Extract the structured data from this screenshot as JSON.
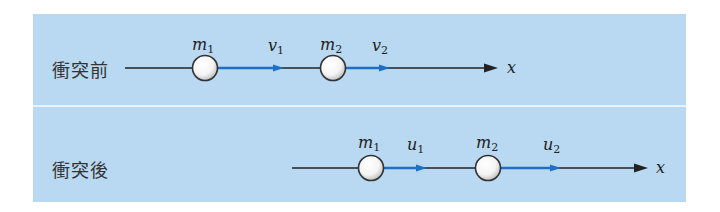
{
  "figure": {
    "background_color": "#b9d9f2",
    "axis_color": "#222222",
    "velocity_color": "#1f6fc5"
  },
  "before": {
    "label": "衝突前",
    "axis_label": "x",
    "balls": [
      {
        "mass_symbol": "m",
        "mass_sub": "1",
        "velocity_symbol": "v",
        "velocity_sub": "1"
      },
      {
        "mass_symbol": "m",
        "mass_sub": "2",
        "velocity_symbol": "v",
        "velocity_sub": "2"
      }
    ]
  },
  "after": {
    "label": "衝突後",
    "axis_label": "x",
    "balls": [
      {
        "mass_symbol": "m",
        "mass_sub": "1",
        "velocity_symbol": "u",
        "velocity_sub": "1"
      },
      {
        "mass_symbol": "m",
        "mass_sub": "2",
        "velocity_symbol": "u",
        "velocity_sub": "2"
      }
    ]
  }
}
